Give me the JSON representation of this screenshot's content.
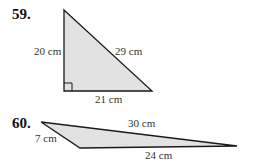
{
  "problems": [
    {
      "number": "59.",
      "shape": "right triangle",
      "labels": {
        "left": "20 cm",
        "hypotenuse": "29 cm",
        "bottom": "21 cm"
      },
      "fill": "#e2e2e2",
      "stroke": "#1a1a1a"
    },
    {
      "number": "60.",
      "shape": "obtuse triangle",
      "labels": {
        "top": "30 cm",
        "left": "7 cm",
        "bottom": "24 cm"
      },
      "fill": "#e2e2e2",
      "stroke": "#1a1a1a"
    }
  ]
}
